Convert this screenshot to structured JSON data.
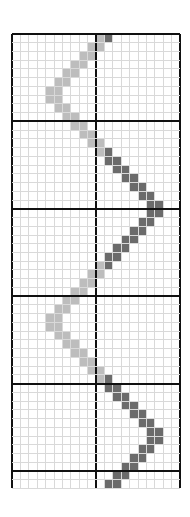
{
  "grid": {
    "columns": 20,
    "rows": 52,
    "cell_width": 8.4,
    "cell_height": 8.74,
    "major_every_rows": 10,
    "major_column": 10,
    "colors": {
      "background": "#ffffff",
      "minor_line": "#d9d9d9",
      "major_line": "#111111",
      "light_fill": "#bdbdbd",
      "dark_fill": "#6b6b6b"
    }
  },
  "cells": {
    "light": [
      [
        0,
        10
      ],
      [
        1,
        9
      ],
      [
        1,
        10
      ],
      [
        2,
        8
      ],
      [
        2,
        9
      ],
      [
        3,
        7
      ],
      [
        3,
        8
      ],
      [
        4,
        6
      ],
      [
        4,
        7
      ],
      [
        5,
        5
      ],
      [
        5,
        6
      ],
      [
        6,
        4
      ],
      [
        6,
        5
      ],
      [
        7,
        4
      ],
      [
        7,
        5
      ],
      [
        8,
        5
      ],
      [
        8,
        6
      ],
      [
        9,
        6
      ],
      [
        9,
        7
      ],
      [
        10,
        7
      ],
      [
        10,
        8
      ],
      [
        11,
        8
      ],
      [
        11,
        9
      ],
      [
        12,
        9
      ],
      [
        12,
        10
      ],
      [
        13,
        10
      ],
      [
        26,
        10
      ],
      [
        27,
        9
      ],
      [
        27,
        10
      ],
      [
        28,
        8
      ],
      [
        28,
        9
      ],
      [
        29,
        7
      ],
      [
        29,
        8
      ],
      [
        30,
        6
      ],
      [
        30,
        7
      ],
      [
        31,
        5
      ],
      [
        31,
        6
      ],
      [
        32,
        4
      ],
      [
        32,
        5
      ],
      [
        33,
        4
      ],
      [
        33,
        5
      ],
      [
        34,
        5
      ],
      [
        34,
        6
      ],
      [
        35,
        6
      ],
      [
        35,
        7
      ],
      [
        36,
        7
      ],
      [
        36,
        8
      ],
      [
        37,
        8
      ],
      [
        37,
        9
      ],
      [
        38,
        9
      ],
      [
        38,
        10
      ],
      [
        39,
        10
      ]
    ],
    "dark": [
      [
        0,
        11
      ],
      [
        13,
        11
      ],
      [
        14,
        11
      ],
      [
        14,
        12
      ],
      [
        15,
        12
      ],
      [
        15,
        13
      ],
      [
        16,
        13
      ],
      [
        16,
        14
      ],
      [
        17,
        14
      ],
      [
        17,
        15
      ],
      [
        18,
        15
      ],
      [
        18,
        16
      ],
      [
        19,
        16
      ],
      [
        19,
        17
      ],
      [
        20,
        16
      ],
      [
        20,
        17
      ],
      [
        21,
        15
      ],
      [
        21,
        16
      ],
      [
        22,
        14
      ],
      [
        22,
        15
      ],
      [
        23,
        13
      ],
      [
        23,
        14
      ],
      [
        24,
        12
      ],
      [
        24,
        13
      ],
      [
        25,
        11
      ],
      [
        25,
        12
      ],
      [
        26,
        11
      ],
      [
        39,
        11
      ],
      [
        40,
        11
      ],
      [
        40,
        12
      ],
      [
        41,
        12
      ],
      [
        41,
        13
      ],
      [
        42,
        13
      ],
      [
        42,
        14
      ],
      [
        43,
        14
      ],
      [
        43,
        15
      ],
      [
        44,
        15
      ],
      [
        44,
        16
      ],
      [
        45,
        16
      ],
      [
        45,
        17
      ],
      [
        46,
        16
      ],
      [
        46,
        17
      ],
      [
        47,
        15
      ],
      [
        47,
        16
      ],
      [
        48,
        14
      ],
      [
        48,
        15
      ],
      [
        49,
        13
      ],
      [
        49,
        14
      ],
      [
        50,
        12
      ],
      [
        50,
        13
      ],
      [
        51,
        11
      ],
      [
        51,
        12
      ]
    ]
  }
}
